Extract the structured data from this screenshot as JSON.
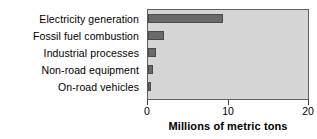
{
  "chart_data": {
    "type": "bar",
    "orientation": "horizontal",
    "title": "",
    "xlabel": "Millions of metric tons",
    "ylabel": "",
    "categories": [
      "Electricity generation",
      "Fossil fuel combustion",
      "Industrial processes",
      "Non-road equipment",
      "On-road vehicles"
    ],
    "values": [
      9.4,
      2.0,
      1.0,
      0.6,
      0.35
    ],
    "xlim": [
      0,
      20
    ],
    "xticks": [
      0,
      10,
      20
    ],
    "xticklabels": [
      "0",
      "10",
      "20"
    ],
    "grid": false,
    "legend": null,
    "colors": {
      "bar_fill": "#6a6a6a",
      "bar_edge": "#4a4a4a",
      "plot_background": "#d6d6d6",
      "plot_border": "#5f5f5f",
      "text": "#000000",
      "page_background": "#ffffff"
    }
  }
}
